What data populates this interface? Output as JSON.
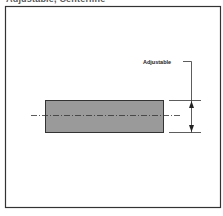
{
  "caption": "Adjustable, Centerline",
  "diagram": {
    "label": "Adjustable",
    "colors": {
      "frame": "#333333",
      "bar_fill": "#9a9a9a",
      "bar_stroke": "#333333",
      "line": "#333333",
      "background": "#ffffff"
    }
  }
}
